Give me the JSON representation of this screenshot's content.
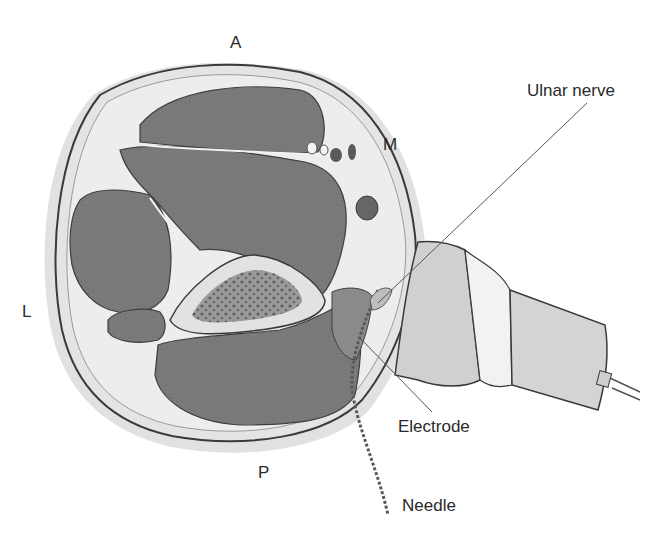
{
  "diagram": {
    "orientation_labels": {
      "anterior": "A",
      "medial": "M",
      "lateral": "L",
      "posterior": "P"
    },
    "callouts": {
      "ulnar_nerve": "Ulnar nerve",
      "electrode": "Electrode",
      "needle": "Needle"
    },
    "colors": {
      "background": "#ffffff",
      "skin_ring": "#d8d8d8",
      "subcutaneous": "#e6e6e6",
      "muscle": "#7a7a7a",
      "bone_cortex": "#e2e2e2",
      "bone_marrow": "#6e6e6e",
      "probe_body": "#d0d0d0",
      "probe_band": "#f2f2f2",
      "outline": "#3a3a3a",
      "text": "#2a2a2a"
    }
  }
}
